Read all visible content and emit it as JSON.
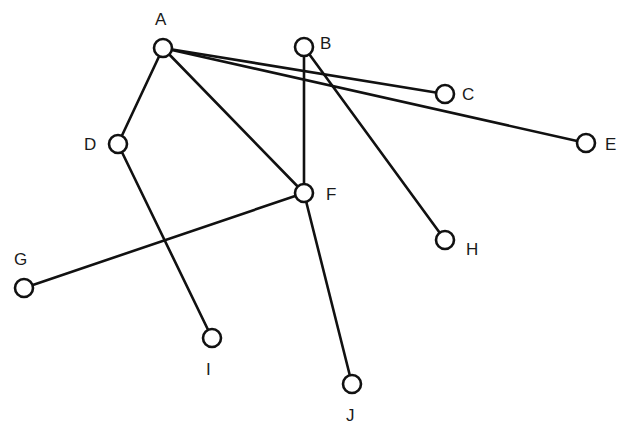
{
  "diagram": {
    "type": "graph",
    "directed": false,
    "node_radius": 9,
    "colors": {
      "background": "#ffffff",
      "stroke": "#111111",
      "node_fill": "#ffffff",
      "label": "#1a1a1a"
    },
    "nodes": [
      {
        "id": "A",
        "label": "A",
        "x": 163,
        "y": 48,
        "label_x": 155,
        "label_y": 25
      },
      {
        "id": "B",
        "label": "B",
        "x": 304,
        "y": 47,
        "label_x": 320,
        "label_y": 49
      },
      {
        "id": "C",
        "label": "C",
        "x": 445,
        "y": 94,
        "label_x": 462,
        "label_y": 100
      },
      {
        "id": "D",
        "label": "D",
        "x": 118,
        "y": 144,
        "label_x": 84,
        "label_y": 150
      },
      {
        "id": "E",
        "label": "E",
        "x": 586,
        "y": 143,
        "label_x": 605,
        "label_y": 150
      },
      {
        "id": "F",
        "label": "F",
        "x": 304,
        "y": 193,
        "label_x": 326,
        "label_y": 200
      },
      {
        "id": "G",
        "label": "G",
        "x": 24,
        "y": 288,
        "label_x": 14,
        "label_y": 265
      },
      {
        "id": "H",
        "label": "H",
        "x": 445,
        "y": 240,
        "label_x": 466,
        "label_y": 255
      },
      {
        "id": "I",
        "label": "I",
        "x": 212,
        "y": 338,
        "label_x": 206,
        "label_y": 375
      },
      {
        "id": "J",
        "label": "J",
        "x": 352,
        "y": 384,
        "label_x": 346,
        "label_y": 421
      }
    ],
    "edges": [
      {
        "from": "A",
        "to": "D"
      },
      {
        "from": "A",
        "to": "F"
      },
      {
        "from": "A",
        "to": "C"
      },
      {
        "from": "A",
        "to": "E"
      },
      {
        "from": "B",
        "to": "F"
      },
      {
        "from": "B",
        "to": "H"
      },
      {
        "from": "D",
        "to": "I"
      },
      {
        "from": "F",
        "to": "G"
      },
      {
        "from": "F",
        "to": "J"
      }
    ]
  }
}
